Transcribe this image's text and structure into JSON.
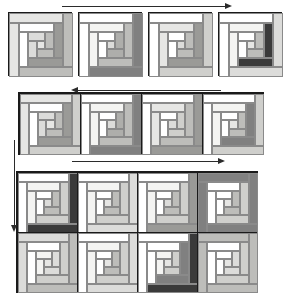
{
  "figure": {
    "kind": "log-cabin-quilt-assembly-diagram",
    "background": "#ffffff",
    "outline_color": "#1a1a1a",
    "guide_color": "#2b2b2b",
    "width": 292,
    "height": 300
  },
  "palette": {
    "white": "#ffffff",
    "offwhite": "#f4f4f2",
    "light": "#e6e6e4",
    "light2": "#dcdcda",
    "mid_light": "#cfcfcc",
    "mid": "#bdbdba",
    "mid2": "#aeaeab",
    "dark_mid": "#9a9a97",
    "dark": "#808080",
    "darker": "#666666",
    "darkest": "#3a3a3a",
    "black": "#2b2b2b"
  },
  "rows": [
    {
      "id": "row-top",
      "label": "top-row-four-separate-blocks",
      "joined": false,
      "block_count": 4,
      "blocks": [
        {
          "id": "block-t1",
          "logs": [
            {
              "side": "outer-ring-1",
              "tone": "light"
            },
            {
              "side": "outer-ring-1-dark",
              "tone": "mid"
            },
            {
              "side": "ring-2",
              "tone": "white"
            },
            {
              "side": "ring-2-dark",
              "tone": "dark_mid"
            },
            {
              "side": "ring-3",
              "tone": "light2"
            },
            {
              "side": "ring-3-dark",
              "tone": "mid"
            },
            {
              "side": "center",
              "tone": "light"
            }
          ]
        },
        {
          "id": "block-t2",
          "logs": [
            {
              "side": "outer-ring-1",
              "tone": "white"
            },
            {
              "side": "outer-ring-1-dark",
              "tone": "dark"
            },
            {
              "side": "ring-2",
              "tone": "offwhite"
            },
            {
              "side": "ring-2-dark",
              "tone": "mid"
            },
            {
              "side": "ring-3",
              "tone": "white"
            },
            {
              "side": "ring-3-dark",
              "tone": "mid2"
            },
            {
              "side": "center",
              "tone": "light2"
            }
          ]
        },
        {
          "id": "block-t3",
          "logs": [
            {
              "side": "outer-ring-1",
              "tone": "white"
            },
            {
              "side": "outer-ring-1-dark",
              "tone": "mid_light"
            },
            {
              "side": "ring-2",
              "tone": "light"
            },
            {
              "side": "ring-2-dark",
              "tone": "dark_mid"
            },
            {
              "side": "ring-3",
              "tone": "white"
            },
            {
              "side": "ring-3-dark",
              "tone": "mid"
            },
            {
              "side": "center",
              "tone": "light2"
            }
          ]
        },
        {
          "id": "block-t4",
          "logs": [
            {
              "side": "outer-ring-1",
              "tone": "white"
            },
            {
              "side": "outer-ring-1-dark",
              "tone": "light2"
            },
            {
              "side": "ring-2",
              "tone": "offwhite"
            },
            {
              "side": "ring-2-dark",
              "tone": "darkest"
            },
            {
              "side": "ring-3",
              "tone": "white"
            },
            {
              "side": "ring-3-dark",
              "tone": "mid"
            },
            {
              "side": "center",
              "tone": "light"
            }
          ]
        }
      ]
    },
    {
      "id": "row-middle",
      "label": "middle-row-four-joined-blocks",
      "joined": true,
      "block_count": 4,
      "blocks": [
        {
          "id": "block-m1",
          "logs": [
            {
              "side": "outer-ring-1",
              "tone": "light"
            },
            {
              "side": "outer-ring-1-dark",
              "tone": "mid_light"
            },
            {
              "side": "ring-2",
              "tone": "white"
            },
            {
              "side": "ring-2-dark",
              "tone": "dark_mid"
            },
            {
              "side": "ring-3",
              "tone": "light2"
            },
            {
              "side": "ring-3-dark",
              "tone": "mid"
            },
            {
              "side": "center",
              "tone": "light"
            }
          ]
        },
        {
          "id": "block-m2",
          "logs": [
            {
              "side": "outer-ring-1",
              "tone": "white"
            },
            {
              "side": "outer-ring-1-dark",
              "tone": "dark"
            },
            {
              "side": "ring-2",
              "tone": "offwhite"
            },
            {
              "side": "ring-2-dark",
              "tone": "mid"
            },
            {
              "side": "ring-3",
              "tone": "white"
            },
            {
              "side": "ring-3-dark",
              "tone": "mid2"
            },
            {
              "side": "center",
              "tone": "light2"
            }
          ]
        },
        {
          "id": "block-m3",
          "logs": [
            {
              "side": "outer-ring-1",
              "tone": "white"
            },
            {
              "side": "outer-ring-1-dark",
              "tone": "dark_mid"
            },
            {
              "side": "ring-2",
              "tone": "light"
            },
            {
              "side": "ring-2-dark",
              "tone": "mid"
            },
            {
              "side": "ring-3",
              "tone": "white"
            },
            {
              "side": "ring-3-dark",
              "tone": "mid_light"
            },
            {
              "side": "center",
              "tone": "light2"
            }
          ]
        },
        {
          "id": "block-m4",
          "logs": [
            {
              "side": "outer-ring-1",
              "tone": "white"
            },
            {
              "side": "outer-ring-1-dark",
              "tone": "mid_light"
            },
            {
              "side": "ring-2",
              "tone": "offwhite"
            },
            {
              "side": "ring-2-dark",
              "tone": "dark"
            },
            {
              "side": "ring-3",
              "tone": "white"
            },
            {
              "side": "ring-3-dark",
              "tone": "mid"
            },
            {
              "side": "center",
              "tone": "light"
            }
          ]
        }
      ]
    },
    {
      "id": "row-bottom-1",
      "label": "bottom-grid-row-1",
      "joined": true,
      "block_count": 4,
      "blocks": [
        {
          "id": "block-b11",
          "logs": [
            {
              "side": "outer-ring-1",
              "tone": "white"
            },
            {
              "side": "outer-ring-1-dark",
              "tone": "darkest"
            },
            {
              "side": "ring-2",
              "tone": "offwhite"
            },
            {
              "side": "ring-2-dark",
              "tone": "mid_light"
            },
            {
              "side": "ring-3",
              "tone": "white"
            },
            {
              "side": "ring-3-dark",
              "tone": "mid"
            },
            {
              "side": "center",
              "tone": "light2"
            }
          ]
        },
        {
          "id": "block-b12",
          "logs": [
            {
              "side": "outer-ring-1",
              "tone": "white"
            },
            {
              "side": "outer-ring-1-dark",
              "tone": "light2"
            },
            {
              "side": "ring-2",
              "tone": "offwhite"
            },
            {
              "side": "ring-2-dark",
              "tone": "mid_light"
            },
            {
              "side": "ring-3",
              "tone": "white"
            },
            {
              "side": "ring-3-dark",
              "tone": "mid"
            },
            {
              "side": "center",
              "tone": "light"
            }
          ]
        },
        {
          "id": "block-b13",
          "logs": [
            {
              "side": "outer-ring-1",
              "tone": "white"
            },
            {
              "side": "outer-ring-1-dark",
              "tone": "dark_mid"
            },
            {
              "side": "ring-2",
              "tone": "offwhite"
            },
            {
              "side": "ring-2-dark",
              "tone": "mid_light"
            },
            {
              "side": "ring-3",
              "tone": "white"
            },
            {
              "side": "ring-3-dark",
              "tone": "mid"
            },
            {
              "side": "center",
              "tone": "light2"
            }
          ]
        },
        {
          "id": "block-b14",
          "logs": [
            {
              "side": "outer-ring-1",
              "tone": "dark"
            },
            {
              "side": "outer-ring-1-dark",
              "tone": "dark"
            },
            {
              "side": "ring-2",
              "tone": "white"
            },
            {
              "side": "ring-2-dark",
              "tone": "mid_light"
            },
            {
              "side": "ring-3",
              "tone": "white"
            },
            {
              "side": "ring-3-dark",
              "tone": "mid"
            },
            {
              "side": "center",
              "tone": "light"
            }
          ]
        }
      ]
    },
    {
      "id": "row-bottom-2",
      "label": "bottom-grid-row-2",
      "joined": true,
      "block_count": 4,
      "blocks": [
        {
          "id": "block-b21",
          "logs": [
            {
              "side": "outer-ring-1",
              "tone": "light2"
            },
            {
              "side": "outer-ring-1-dark",
              "tone": "mid"
            },
            {
              "side": "ring-2",
              "tone": "white"
            },
            {
              "side": "ring-2-dark",
              "tone": "mid_light"
            },
            {
              "side": "ring-3",
              "tone": "offwhite"
            },
            {
              "side": "ring-3-dark",
              "tone": "light2"
            },
            {
              "side": "center",
              "tone": "light"
            }
          ]
        },
        {
          "id": "block-b22",
          "logs": [
            {
              "side": "outer-ring-1",
              "tone": "white"
            },
            {
              "side": "outer-ring-1-dark",
              "tone": "light2"
            },
            {
              "side": "ring-2",
              "tone": "offwhite"
            },
            {
              "side": "ring-2-dark",
              "tone": "mid_light"
            },
            {
              "side": "ring-3",
              "tone": "white"
            },
            {
              "side": "ring-3-dark",
              "tone": "mid"
            },
            {
              "side": "center",
              "tone": "light"
            }
          ]
        },
        {
          "id": "block-b23",
          "logs": [
            {
              "side": "outer-ring-1",
              "tone": "white"
            },
            {
              "side": "outer-ring-1-dark",
              "tone": "darkest"
            },
            {
              "side": "ring-2",
              "tone": "white"
            },
            {
              "side": "ring-2-dark",
              "tone": "dark"
            },
            {
              "side": "ring-3",
              "tone": "offwhite"
            },
            {
              "side": "ring-3-dark",
              "tone": "mid_light"
            },
            {
              "side": "center",
              "tone": "light"
            }
          ]
        },
        {
          "id": "block-b24",
          "logs": [
            {
              "side": "outer-ring-1",
              "tone": "mid"
            },
            {
              "side": "outer-ring-1-dark",
              "tone": "mid"
            },
            {
              "side": "ring-2",
              "tone": "white"
            },
            {
              "side": "ring-2-dark",
              "tone": "mid_light"
            },
            {
              "side": "ring-3",
              "tone": "white"
            },
            {
              "side": "ring-3-dark",
              "tone": "light2"
            },
            {
              "side": "center",
              "tone": "light"
            }
          ]
        }
      ]
    }
  ],
  "guides": [
    {
      "id": "guide-top-horizontal",
      "name": "top-direction-line",
      "direction": "right",
      "x": 62,
      "y": 6,
      "length": 165
    },
    {
      "id": "guide-middle-horizontal",
      "name": "middle-direction-line",
      "direction": "left",
      "x": 76,
      "y": 90,
      "length": 145
    },
    {
      "id": "guide-middle-left-vertical",
      "name": "middle-left-vertical-line",
      "direction": "none",
      "x": 14,
      "y": 140,
      "length": 30
    },
    {
      "id": "guide-bottom-horizontal",
      "name": "bottom-direction-line",
      "direction": "right",
      "x": 72,
      "y": 161,
      "length": 148
    },
    {
      "id": "guide-bottom-left-vertical",
      "name": "bottom-left-vertical-line",
      "direction": "down",
      "x": 14,
      "y": 167,
      "length": 60
    }
  ]
}
